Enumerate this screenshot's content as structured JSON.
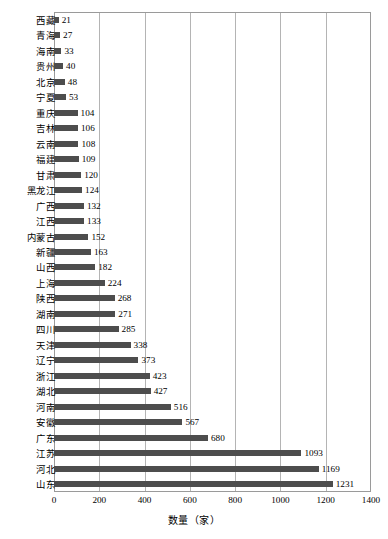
{
  "chart_data": {
    "type": "bar",
    "orientation": "horizontal",
    "title": "",
    "xlabel": "数量（家）",
    "ylabel": "",
    "xlim": [
      0,
      1400
    ],
    "xticks": [
      0,
      200,
      400,
      600,
      800,
      1000,
      1200,
      1400
    ],
    "grid": true,
    "legend": false,
    "bar_color": "#4d4d4d",
    "categories": [
      "西藏",
      "青海",
      "海南",
      "贵州",
      "北京",
      "宁夏",
      "重庆",
      "吉林",
      "云南",
      "福建",
      "甘肃",
      "黑龙江",
      "广西",
      "江西",
      "内蒙古",
      "新疆",
      "山西",
      "上海",
      "陕西",
      "湖南",
      "四川",
      "天津",
      "辽宁",
      "浙江",
      "湖北",
      "河南",
      "安徽",
      "广东",
      "江苏",
      "河北",
      "山东"
    ],
    "values": [
      21,
      27,
      33,
      40,
      48,
      53,
      104,
      106,
      108,
      109,
      120,
      124,
      132,
      133,
      152,
      163,
      182,
      224,
      268,
      271,
      285,
      338,
      373,
      423,
      427,
      516,
      567,
      680,
      1093,
      1169,
      1231
    ],
    "data_labels": [
      "21",
      "27",
      "33",
      "40",
      "48",
      "53",
      "104",
      "106",
      "108",
      "109",
      "120",
      "124",
      "132",
      "133",
      "152",
      "163",
      "182",
      "224",
      "268",
      "271",
      "285",
      "338",
      "373",
      "423",
      "427",
      "516",
      "567",
      "680",
      "1093",
      "1169",
      "1231"
    ]
  }
}
